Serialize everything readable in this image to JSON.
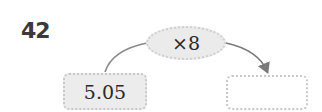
{
  "problem": {
    "number": "42",
    "operation": "×8",
    "input_value": "5.05",
    "output_value": ""
  },
  "colors": {
    "ellipse_fill": "#ebebeb",
    "input_box_fill": "#ececec",
    "output_box_fill": "#ffffff",
    "arrow": "#7a7a7a"
  }
}
